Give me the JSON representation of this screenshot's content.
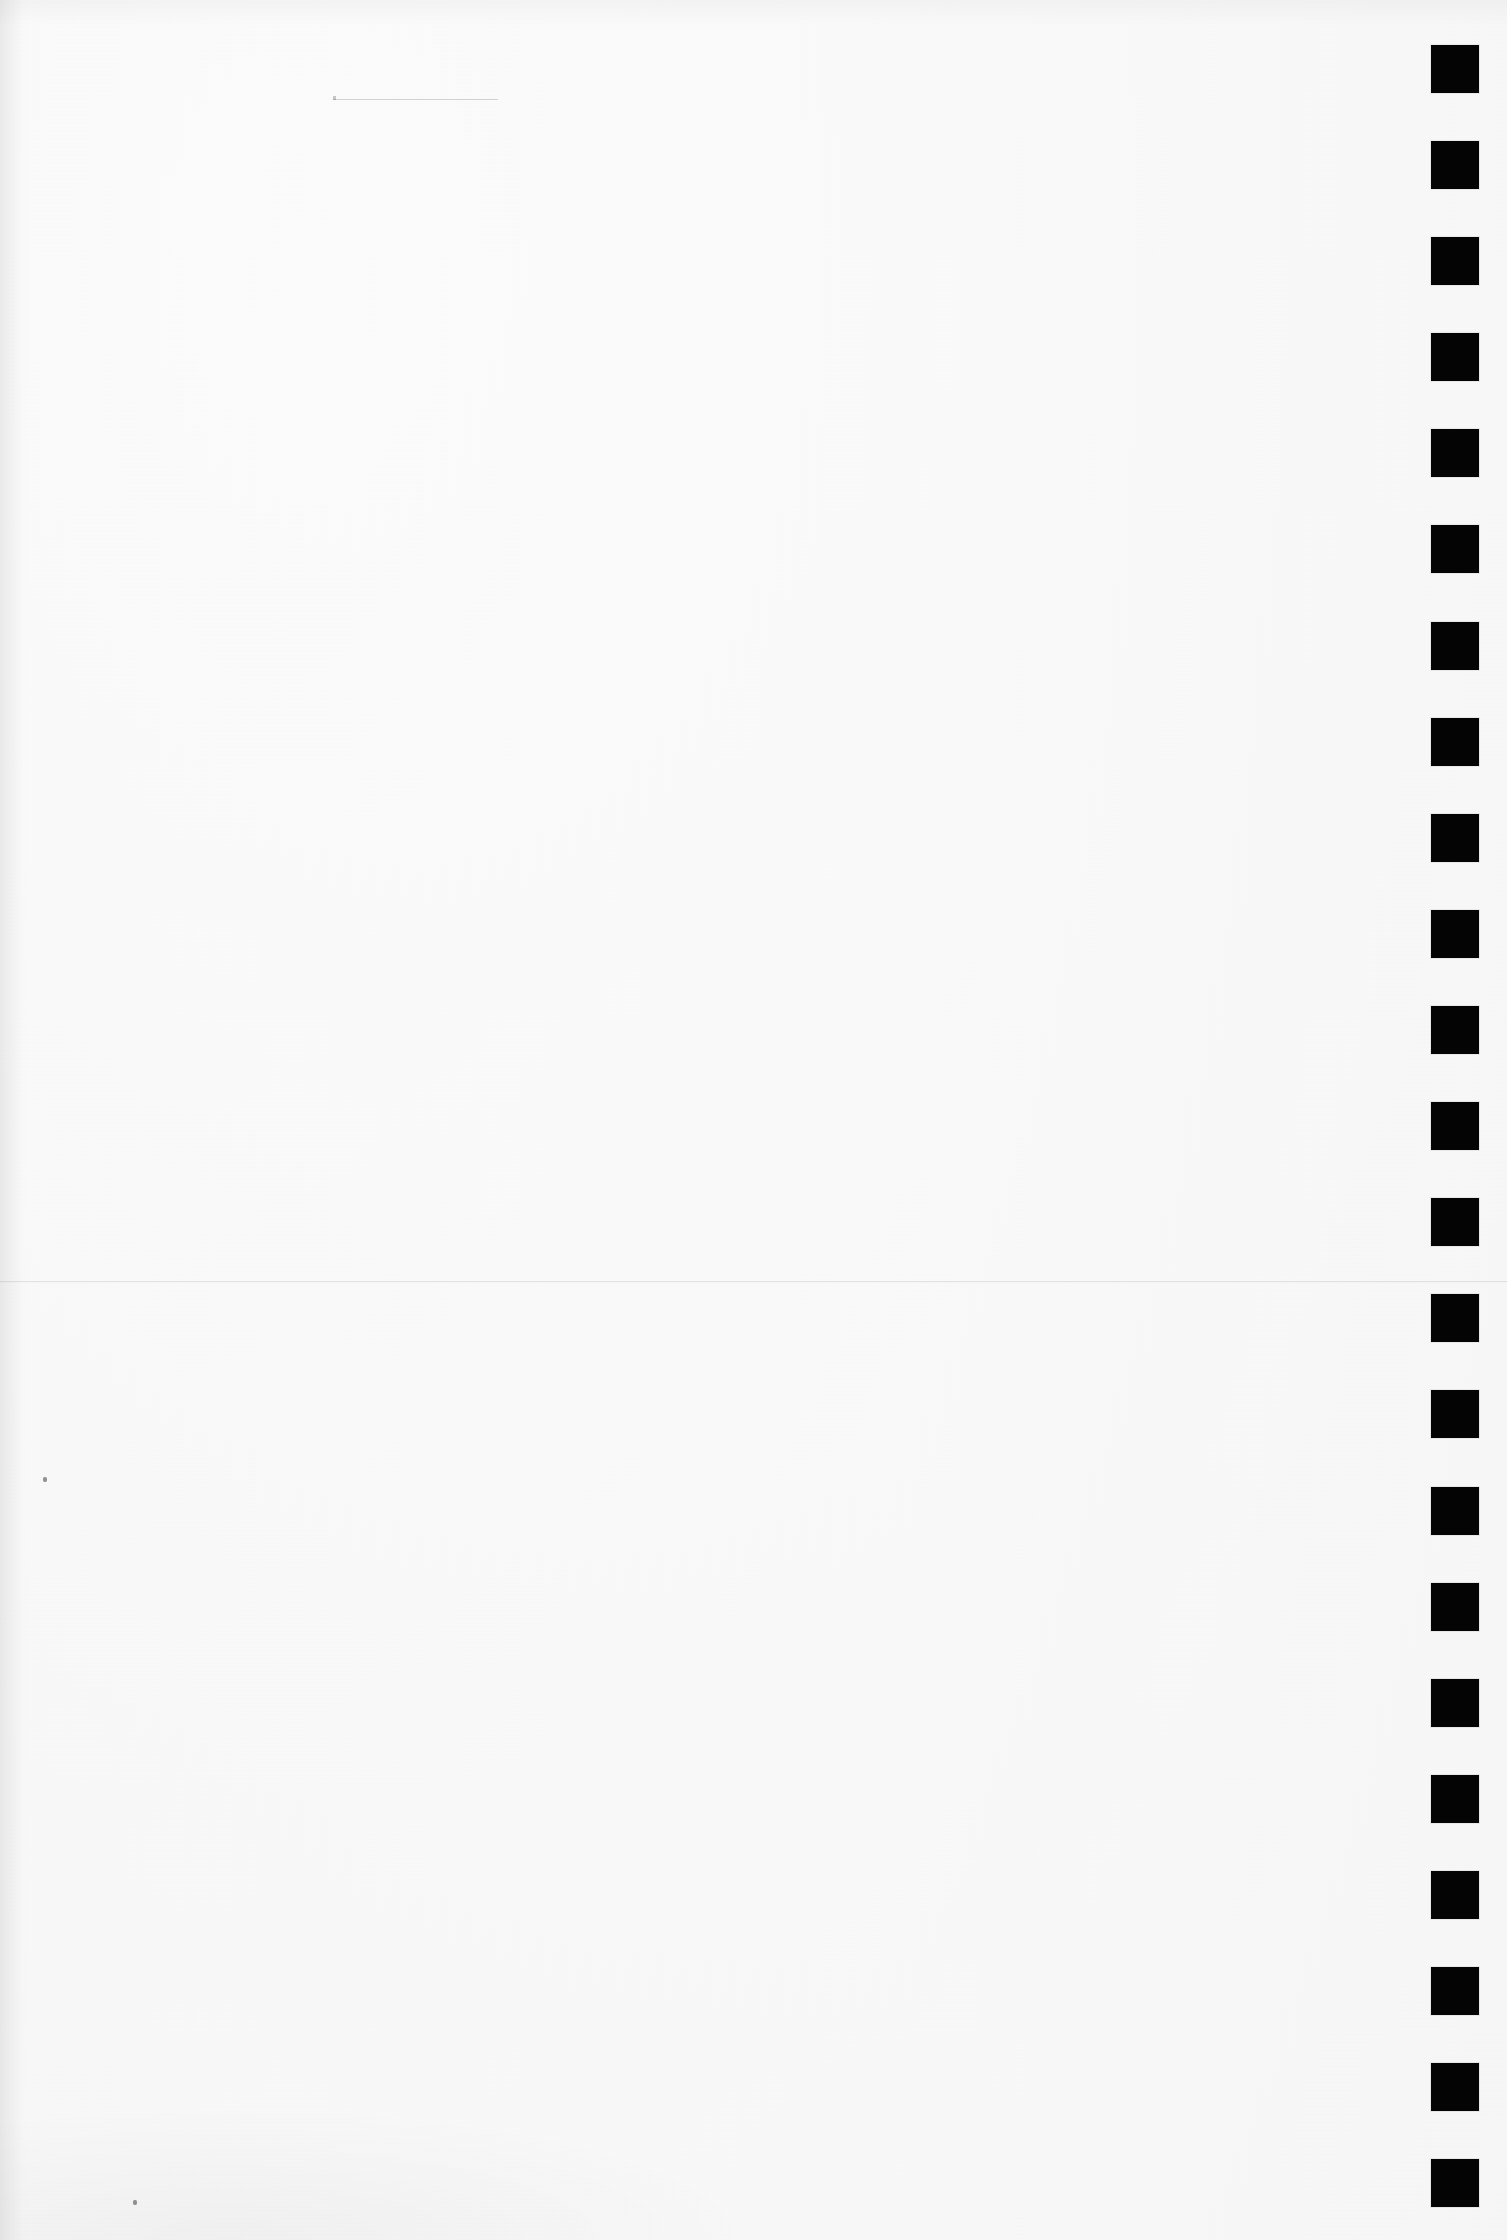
{
  "page": {
    "kind": "scanned-blank-page",
    "width_px": 1507,
    "height_px": 2240,
    "background_color": "#fdfdfd",
    "ink_color": "#040404",
    "visible_text": "",
    "note": ""
  },
  "registration_marks": {
    "name": "registration-mark-column",
    "count": 23,
    "shape": "square",
    "color": "#040404",
    "size_px": 48,
    "left_px": 1431,
    "first_top_px": 45,
    "pitch_px": 96.05,
    "right_margin_px": 28,
    "tops_px": [
      45,
      141,
      237,
      333,
      429,
      525,
      622,
      718,
      814,
      910,
      1006,
      1102,
      1198,
      1294,
      1390,
      1487,
      1583,
      1679,
      1775,
      1871,
      1967,
      2063,
      2159
    ]
  },
  "seam_line": {
    "name": "page-seam-line",
    "y_px": 1281,
    "color": "#000000",
    "opacity": 0.085,
    "thickness_px": 1,
    "full_width": true
  },
  "hair_rule": {
    "name": "faint-hairline-rule",
    "x_px": 333,
    "y_px": 99,
    "width_px": 165,
    "color": "#000000",
    "opacity": 0.16,
    "thickness_px": 1
  },
  "specks": [
    {
      "name": "dust-speck",
      "x_px": 43,
      "y_px": 1477
    },
    {
      "name": "dust-speck",
      "x_px": 133,
      "y_px": 2200
    }
  ]
}
